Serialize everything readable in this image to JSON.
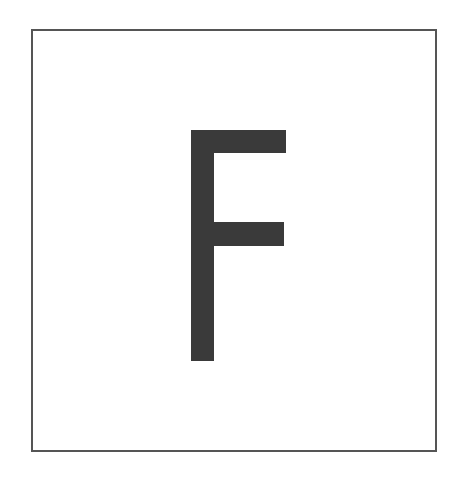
{
  "card": {
    "letter": "F",
    "border_color": "#555555",
    "glyph_color": "#3a3a3a",
    "background": "#ffffff"
  }
}
